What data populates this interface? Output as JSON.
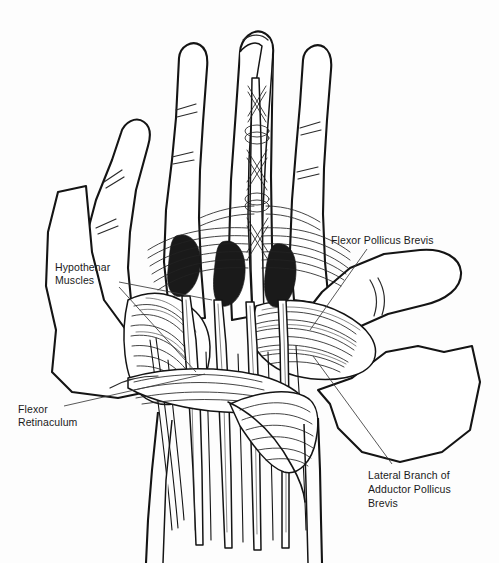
{
  "figure": {
    "type": "anatomical-line-drawing",
    "background_color": "#fdfdfd",
    "ink_color": "#141414",
    "width": 499,
    "height": 563
  },
  "labels": [
    {
      "id": "flexor-pollicus-brevis",
      "text": "Flexor Pollicus Brevis",
      "lines": [
        "Flexor Pollicus Brevis"
      ],
      "x": 331,
      "y": 234,
      "align": "left",
      "leader": {
        "from": [
          367,
          249
        ],
        "to": [
          310,
          330
        ]
      }
    },
    {
      "id": "hypothenar-muscles",
      "text": "Hypothenar Muscles",
      "lines": [
        "Hypothenar",
        "Muscles"
      ],
      "x": 55,
      "y": 261,
      "align": "left",
      "leader": {
        "from": [
          119,
          284
        ],
        "to": [
          210,
          300
        ]
      },
      "leader2": {
        "from": [
          119,
          288
        ],
        "to": [
          196,
          372
        ]
      }
    },
    {
      "id": "flexor-retinaculum",
      "text": "Flexor Retinaculum",
      "lines": [
        "Flexor",
        "Retinaculum"
      ],
      "x": 18,
      "y": 403,
      "align": "left",
      "leader": {
        "from": [
          64,
          407
        ],
        "to": [
          205,
          375
        ]
      }
    },
    {
      "id": "lateral-branch-adductor-pollicus-brevis",
      "text": "Lateral Branch of Adductor Pollicus Brevis",
      "lines": [
        "Lateral Branch of",
        "Adductor Pollicus",
        "Brevis"
      ],
      "x": 368,
      "y": 469,
      "align": "left",
      "leader": {
        "from": [
          392,
          465
        ],
        "to": [
          313,
          357
        ]
      }
    }
  ],
  "structures": [
    {
      "name": "index-finger",
      "kind": "digit"
    },
    {
      "name": "middle-finger-dissected",
      "kind": "digit"
    },
    {
      "name": "ring-finger",
      "kind": "digit"
    },
    {
      "name": "little-finger",
      "kind": "digit"
    },
    {
      "name": "thumb",
      "kind": "digit"
    },
    {
      "name": "thenar-eminence",
      "kind": "muscle-group"
    },
    {
      "name": "hypothenar-eminence",
      "kind": "muscle-group"
    },
    {
      "name": "flexor-retinaculum-band",
      "kind": "ligament"
    },
    {
      "name": "flexor-tendons",
      "kind": "tendon-group"
    },
    {
      "name": "palmar-aponeurosis",
      "kind": "fascia"
    },
    {
      "name": "skin-flap-left",
      "kind": "reflected-skin"
    },
    {
      "name": "skin-flap-right",
      "kind": "reflected-skin"
    },
    {
      "name": "forearm",
      "kind": "limb-segment"
    }
  ]
}
